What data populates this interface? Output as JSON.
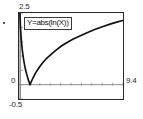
{
  "app": {
    "title": "Graph Plot"
  },
  "plot": {
    "expression_label": "Y=abs(ln(X))",
    "y_max_label": "2.5",
    "y_min_label": "-0.5",
    "y_zero_label": "0",
    "x_max_label": "9.4",
    "x_min_label": "0",
    "axis_color": "#8c8c8c",
    "curve_color": "#111111",
    "frame_color": "#2b2b2b",
    "background_color": "#ffffff"
  },
  "chart_data": {
    "type": "line",
    "title": "Y=abs(ln(X))",
    "xlabel": "",
    "ylabel": "",
    "xlim": [
      0,
      9.4
    ],
    "ylim": [
      -0.5,
      2.5
    ],
    "grid": false,
    "legend": "none",
    "annotations": [
      "Y=abs(ln(X))"
    ],
    "tick_labels": {
      "x": [
        "0",
        "9.4"
      ],
      "y": [
        "-0.5",
        "0",
        "2.5"
      ]
    },
    "x_tick_count": 10,
    "y_tick_count": 6,
    "series": [
      {
        "name": "Y=abs(ln(X))",
        "x": [
          0.08,
          0.12,
          0.16,
          0.2,
          0.25,
          0.3,
          0.35,
          0.4,
          0.45,
          0.5,
          0.55,
          0.6,
          0.65,
          0.7,
          0.75,
          0.8,
          0.85,
          0.9,
          0.95,
          1.0,
          1.1,
          1.2,
          1.35,
          1.5,
          1.7,
          1.9,
          2.2,
          2.5,
          2.9,
          3.3,
          3.8,
          4.3,
          4.9,
          5.5,
          6.2,
          6.9,
          7.6,
          8.3,
          8.9,
          9.4
        ],
        "y": [
          2.53,
          2.12,
          1.83,
          1.61,
          1.39,
          1.2,
          1.05,
          0.92,
          0.8,
          0.69,
          0.6,
          0.51,
          0.43,
          0.36,
          0.29,
          0.22,
          0.16,
          0.11,
          0.05,
          0.0,
          0.1,
          0.18,
          0.3,
          0.41,
          0.53,
          0.64,
          0.79,
          0.92,
          1.06,
          1.19,
          1.34,
          1.46,
          1.59,
          1.7,
          1.82,
          1.93,
          2.03,
          2.12,
          2.19,
          2.24
        ]
      }
    ]
  }
}
